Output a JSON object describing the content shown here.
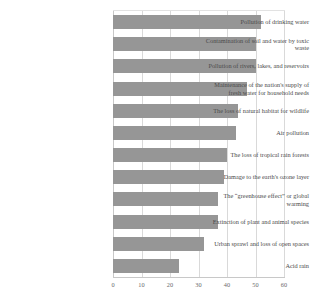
{
  "chart_data": {
    "type": "bar",
    "orientation": "horizontal",
    "title": "",
    "subtitle": "",
    "xlabel": "",
    "ylabel": "",
    "xlim": [
      0,
      60
    ],
    "xticks": [
      0,
      10,
      20,
      30,
      40,
      50,
      60
    ],
    "xtick_labels": [
      "0",
      "10",
      "20",
      "30",
      "40",
      "50",
      "60"
    ],
    "grid": true,
    "grid_axis": "x",
    "legend": false,
    "legend_position": "none",
    "bar_color": "#969696",
    "gridline_color": "#d9d9d9",
    "categories": [
      "Pollution of drinking water",
      "Contamination of soil and water by toxic waste",
      "Pollution of rivers, lakes, and reservoirs",
      "Maintenance of the nation's supply of fresh water for household needs",
      "The loss of natural habitat for wildlife",
      "Air pollution",
      "The loss of tropical rain forests",
      "Damage to the earth's ozone layer",
      "The “greenhouse effect” or global warming",
      "Extinction of plant and animal species",
      "Urban sprawl and loss of open spaces",
      "Acid rain"
    ],
    "values": [
      52,
      50,
      50,
      47,
      44,
      43,
      40,
      39,
      37,
      37,
      32,
      23
    ]
  }
}
